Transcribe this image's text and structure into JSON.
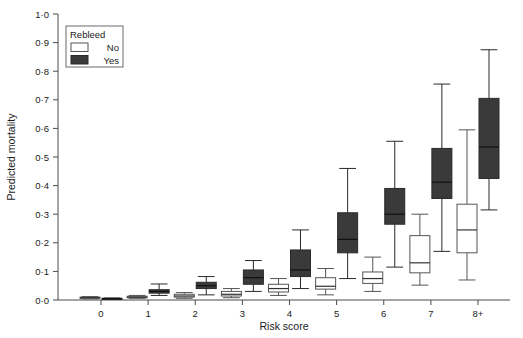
{
  "chart_data": {
    "type": "box",
    "title": "",
    "xlabel": "Risk score",
    "ylabel": "Predicted mortality",
    "categories": [
      "0",
      "1",
      "2",
      "3",
      "4",
      "5",
      "6",
      "7",
      "8+"
    ],
    "ylim": [
      0.0,
      1.0
    ],
    "ytick_labels": [
      "0·0",
      "0·1",
      "0·2",
      "0·3",
      "0·4",
      "0·5",
      "0·6",
      "0·7",
      "0·8",
      "0·9",
      "1·0"
    ],
    "ytick_values": [
      0.0,
      0.1,
      0.2,
      0.3,
      0.4,
      0.5,
      0.6,
      0.7,
      0.8,
      0.9,
      1.0
    ],
    "grid": false,
    "legend": {
      "title": "Rebleed",
      "position": "top-left",
      "entries": [
        {
          "label": "No",
          "fill": "#ffffff",
          "stroke": "#555555"
        },
        {
          "label": "Yes",
          "fill": "#3a3a3a",
          "stroke": "#2a2a2a"
        }
      ]
    },
    "series": [
      {
        "name": "No",
        "fill": "#ffffff",
        "stroke": "#555555",
        "boxes": [
          {
            "category": "0",
            "whisker_low": 0.004,
            "q1": 0.006,
            "median": 0.008,
            "q3": 0.01,
            "whisker_high": 0.012
          },
          {
            "category": "1",
            "whisker_low": 0.006,
            "q1": 0.008,
            "median": 0.01,
            "q3": 0.013,
            "whisker_high": 0.016
          },
          {
            "category": "2",
            "whisker_low": 0.006,
            "q1": 0.01,
            "median": 0.014,
            "q3": 0.02,
            "whisker_high": 0.026
          },
          {
            "category": "3",
            "whisker_low": 0.008,
            "q1": 0.014,
            "median": 0.02,
            "q3": 0.03,
            "whisker_high": 0.04
          },
          {
            "category": "4",
            "whisker_low": 0.016,
            "q1": 0.028,
            "median": 0.04,
            "q3": 0.055,
            "whisker_high": 0.075
          },
          {
            "category": "5",
            "whisker_low": 0.018,
            "q1": 0.038,
            "median": 0.048,
            "q3": 0.078,
            "whisker_high": 0.11
          },
          {
            "category": "6",
            "whisker_low": 0.03,
            "q1": 0.058,
            "median": 0.075,
            "q3": 0.098,
            "whisker_high": 0.15
          },
          {
            "category": "7",
            "whisker_low": 0.052,
            "q1": 0.095,
            "median": 0.13,
            "q3": 0.225,
            "whisker_high": 0.3
          },
          {
            "category": "8+",
            "whisker_low": 0.07,
            "q1": 0.165,
            "median": 0.245,
            "q3": 0.335,
            "whisker_high": 0.595
          }
        ]
      },
      {
        "name": "Yes",
        "fill": "#3a3a3a",
        "stroke": "#2a2a2a",
        "boxes": [
          {
            "category": "0",
            "whisker_low": 0.003,
            "q1": 0.004,
            "median": 0.005,
            "q3": 0.006,
            "whisker_high": 0.007
          },
          {
            "category": "1",
            "whisker_low": 0.016,
            "q1": 0.024,
            "median": 0.03,
            "q3": 0.036,
            "whisker_high": 0.056
          },
          {
            "category": "2",
            "whisker_low": 0.018,
            "q1": 0.04,
            "median": 0.05,
            "q3": 0.062,
            "whisker_high": 0.082
          },
          {
            "category": "3",
            "whisker_low": 0.03,
            "q1": 0.055,
            "median": 0.078,
            "q3": 0.105,
            "whisker_high": 0.138
          },
          {
            "category": "4",
            "whisker_low": 0.04,
            "q1": 0.082,
            "median": 0.105,
            "q3": 0.175,
            "whisker_high": 0.245
          },
          {
            "category": "5",
            "whisker_low": 0.075,
            "q1": 0.165,
            "median": 0.212,
            "q3": 0.305,
            "whisker_high": 0.46
          },
          {
            "category": "6",
            "whisker_low": 0.115,
            "q1": 0.265,
            "median": 0.3,
            "q3": 0.39,
            "whisker_high": 0.555
          },
          {
            "category": "7",
            "whisker_low": 0.17,
            "q1": 0.355,
            "median": 0.412,
            "q3": 0.53,
            "whisker_high": 0.755
          },
          {
            "category": "8+",
            "whisker_low": 0.315,
            "q1": 0.425,
            "median": 0.535,
            "q3": 0.705,
            "whisker_high": 0.875
          }
        ]
      }
    ]
  }
}
